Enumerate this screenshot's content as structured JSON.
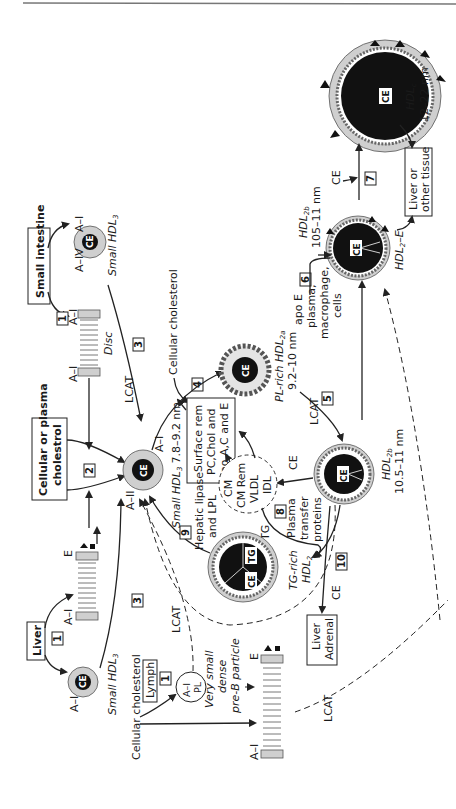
{
  "figure": {
    "orientation": "rotated-90-ccw",
    "top_rule": true
  },
  "sources": {
    "small_intestine": "Small intestine",
    "liver": "Liver",
    "cellular_or_plasma_cholestrol_1": "Cellular or plasma",
    "cellular_or_plasma_cholestrol_2": "cholestrol",
    "lymph": "Lymph",
    "cellular_cholesterol_top": "Cellular cholesterol",
    "cellular_cholesterol_bottom": "Cellular cholesterol",
    "liver_adrenal_1": "Liver",
    "liver_adrenal_2": "Adrenal",
    "liver_other_1": "Liver or",
    "liver_other_2": "other tissue"
  },
  "steps": [
    "1",
    "1",
    "1",
    "2",
    "3",
    "3",
    "4",
    "5",
    "6",
    "7",
    "8",
    "9",
    "10"
  ],
  "particles": {
    "disc_intestine": {
      "label": "Disc",
      "apo_left": "A–I",
      "apo_right": "A–I"
    },
    "small_hdl3_intestine": {
      "label": "Small HDL",
      "sub": "3",
      "apo_left": "A–IV",
      "apo_right": "A–I",
      "core": "CE"
    },
    "disc_liver": {
      "apo_left": "A–I",
      "apo_right": "E"
    },
    "small_hdl3_liver": {
      "label": "Small HDL",
      "sub": "3",
      "apo": "A–I",
      "core": "CE"
    },
    "central_hdl3": {
      "label": "Small HDL",
      "sub": "3",
      "size": "7.8–9.2 nm",
      "apo_top": "A–I",
      "apo_bottom": "A–II",
      "core": "CE"
    },
    "pl_rich_hdl2a": {
      "label": "PL-rich HDL",
      "sub": "2a",
      "size": "9.2–10 nm",
      "core": "CE"
    },
    "hdl2b_mid": {
      "label": "HDL",
      "sub": "2b",
      "size": "10.5–11 nm",
      "core": "CE"
    },
    "hdl2b_upper": {
      "label": "HDL",
      "sub": "2b",
      "size": "105–11 nm",
      "core": "CE"
    },
    "hdl2e": {
      "label": "HDL",
      "sub": "2",
      "suffix": "–E",
      "core": "CE"
    },
    "hdlc": {
      "label": "HDL",
      "sub": "c",
      "size": "12–22 nm",
      "core": "CE"
    },
    "tg_rich_hdl2": {
      "label": "TG-rich",
      "label2": "HDL",
      "sub": "2",
      "core1": "TG",
      "core2": "CE"
    },
    "lymph_particle": {
      "line1": "A–I",
      "line2": "PL"
    },
    "pre_b": {
      "line1": "Very small",
      "line2": "dense",
      "line3": "pre-B particle"
    },
    "disc_lower": {
      "apo_left": "A–I",
      "apo_right": "E"
    },
    "remnants": {
      "line1": "CM",
      "line2": "CM Rem",
      "line3": "VLDL",
      "line4": "IDL"
    }
  },
  "labels": {
    "lcat": "LCAT",
    "surface_rem_1": "Surface rem",
    "surface_rem_2": "PC,Chol and",
    "surface_rem_3": "apo A,C and E",
    "hepatic_lipase_1": "Hepatic lipase",
    "hepatic_lipase_2": "and LPL",
    "plasma_transfer_1": "Plasma",
    "plasma_transfer_2": "transfer",
    "plasma_transfer_3": "proteins",
    "apoe_1": "apo E",
    "apoe_2": "plasma,",
    "apoe_3": "macrophage,",
    "apoe_4": "cells",
    "ce": "CE",
    "tg": "TG"
  }
}
